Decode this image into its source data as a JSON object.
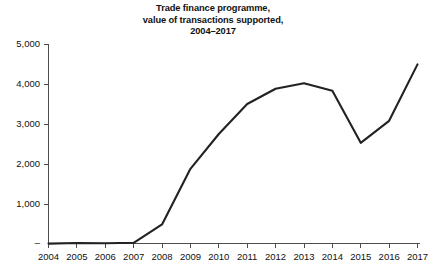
{
  "chart_data": {
    "type": "line",
    "title": "Trade finance programme, value of transactions supported, 2004–2017",
    "title_lines": [
      "Trade finance programme,",
      "value of transactions supported,",
      "2004–2017"
    ],
    "xlabel": "",
    "ylabel": "",
    "categories": [
      "2004",
      "2005",
      "2006",
      "2007",
      "2008",
      "2009",
      "2010",
      "2011",
      "2012",
      "2013",
      "2014",
      "2015",
      "2016",
      "2017"
    ],
    "values": [
      10,
      25,
      20,
      30,
      490,
      1880,
      2750,
      3500,
      3880,
      4020,
      3830,
      2530,
      3080,
      4490
    ],
    "series": [
      {
        "name": "Value of transactions supported",
        "values": [
          10,
          25,
          20,
          30,
          490,
          1880,
          2750,
          3500,
          3880,
          4020,
          3830,
          2530,
          3080,
          4490
        ]
      }
    ],
    "ylim": [
      0,
      5000
    ],
    "yticks": [
      0,
      1000,
      2000,
      3000,
      4000,
      5000
    ],
    "ytick_labels": [
      "–",
      "1,000",
      "2,000",
      "3,000",
      "4,000",
      "5,000"
    ],
    "xtick_labels": [
      "2004",
      "2005",
      "2006",
      "2007",
      "2008",
      "2009",
      "2010",
      "2011",
      "2012",
      "2013",
      "2014",
      "2015",
      "2016",
      "2017"
    ],
    "grid": false,
    "legend": null,
    "line_color": "#222222",
    "axis_color": "#4d4d4d",
    "background_color": "#ffffff"
  }
}
